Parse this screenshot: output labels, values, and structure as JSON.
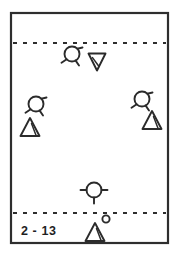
{
  "diagram": {
    "label": "2 - 13",
    "frame": {
      "x": 11,
      "y": 13,
      "width": 157,
      "height": 230
    },
    "colors": {
      "ink": "#2b2b2b",
      "frame": "#2e2e2e",
      "background": "#ffffff",
      "label": "#1f1f1f"
    },
    "boundary_lines": [
      {
        "name": "upper-boundary",
        "y": 43
      },
      {
        "name": "lower-boundary",
        "y": 213
      }
    ],
    "markers": [
      {
        "id": "circle-top-center",
        "kind": "circle-with-stubs",
        "cx": 72,
        "cy": 54,
        "r": 7.5,
        "stubs": "diagonal"
      },
      {
        "id": "triangle-down-top",
        "kind": "triangle-down",
        "cx": 97,
        "cy": 62,
        "size": 8.5
      },
      {
        "id": "circle-left-middle",
        "kind": "circle-with-stubs",
        "cx": 36,
        "cy": 104,
        "r": 7.5,
        "stubs": "diagonal"
      },
      {
        "id": "circle-right-middle",
        "kind": "circle-with-stubs",
        "cx": 142,
        "cy": 99,
        "r": 7.5,
        "stubs": "diagonal"
      },
      {
        "id": "triangle-up-left",
        "kind": "triangle-up-hatched",
        "cx": 30,
        "cy": 127,
        "size": 9
      },
      {
        "id": "triangle-up-right",
        "kind": "triangle-up-hatched",
        "cx": 152,
        "cy": 120,
        "size": 9
      },
      {
        "id": "circle-bottom-center",
        "kind": "circle-with-stubs",
        "cx": 94,
        "cy": 190,
        "r": 7.5,
        "stubs": "orthogonal"
      },
      {
        "id": "triangle-up-bottom",
        "kind": "triangle-up-hatched",
        "cx": 95,
        "cy": 232,
        "size": 9
      },
      {
        "id": "circle-small-bottom",
        "kind": "circle-plain",
        "cx": 106,
        "cy": 219,
        "r": 3.6
      }
    ]
  }
}
